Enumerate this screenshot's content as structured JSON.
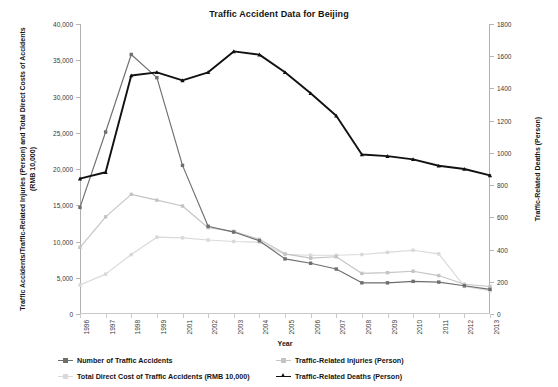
{
  "chart_data": {
    "type": "line",
    "title": "Traffic Accident Data for Beijing",
    "xlabel": "Year",
    "ylabel_left": "Traffic Accidents/Traffic-Related Injuries (Person) and Total Direct Costs of Accidents (RMB 10,000)",
    "ylabel_right": "Traffic-Related Deaths (Person)",
    "grid": false,
    "legend_position": "bottom",
    "categories": [
      "1996",
      "1997",
      "1998",
      "1999",
      "2001",
      "2002",
      "2003",
      "2004",
      "2005",
      "2006",
      "2007",
      "2008",
      "2009",
      "2010",
      "2011",
      "2012",
      "2013"
    ],
    "ylim_left": [
      0,
      40000
    ],
    "ylim_right": [
      0,
      1800
    ],
    "yticks_left": [
      "0",
      "5,000",
      "10,000",
      "15,000",
      "20,000",
      "25,000",
      "30,000",
      "35,000",
      "40,000"
    ],
    "yticks_right": [
      "0",
      "200",
      "400",
      "600",
      "800",
      "1000",
      "1200",
      "1400",
      "1600",
      "1800"
    ],
    "series": [
      {
        "name": "Number of Traffic Accidents",
        "axis": "left",
        "color": "#6e6e6e",
        "marker": "square",
        "values": [
          14700,
          25100,
          35800,
          32600,
          20500,
          12100,
          11300,
          10100,
          7600,
          7000,
          6200,
          4300,
          4300,
          4500,
          4400,
          3900,
          3400
        ]
      },
      {
        "name": "Traffic-Related Injuries (Person)",
        "axis": "left",
        "color": "#c4c4c4",
        "marker": "square",
        "values": [
          9200,
          13400,
          16500,
          15700,
          14900,
          11900,
          11400,
          10300,
          8300,
          7700,
          7900,
          5600,
          5700,
          5900,
          5300,
          4100,
          3800
        ]
      },
      {
        "name": "Total Direct Cost of Traffic Accidents (RMB 10,000)",
        "axis": "left",
        "color": "#d9d9d9",
        "marker": "square",
        "values": [
          4000,
          5500,
          8200,
          10600,
          10500,
          10200,
          10000,
          9900,
          8200,
          8100,
          8100,
          8200,
          8500,
          8800,
          8300,
          3800,
          3200
        ]
      },
      {
        "name": "Traffic-Related Deaths (Person)",
        "axis": "right",
        "color": "#111111",
        "marker": "triangle",
        "values": [
          840,
          880,
          1480,
          1500,
          1450,
          1500,
          1630,
          1610,
          1500,
          1370,
          1230,
          990,
          980,
          960,
          920,
          900,
          860
        ]
      }
    ]
  },
  "legend": {
    "items": [
      {
        "label": "Number of Traffic Accidents"
      },
      {
        "label": "Traffic-Related Injuries (Person)"
      },
      {
        "label": "Total Direct Cost of Traffic Accidents (RMB 10,000)"
      },
      {
        "label": "Traffic-Related Deaths (Person)"
      }
    ]
  }
}
